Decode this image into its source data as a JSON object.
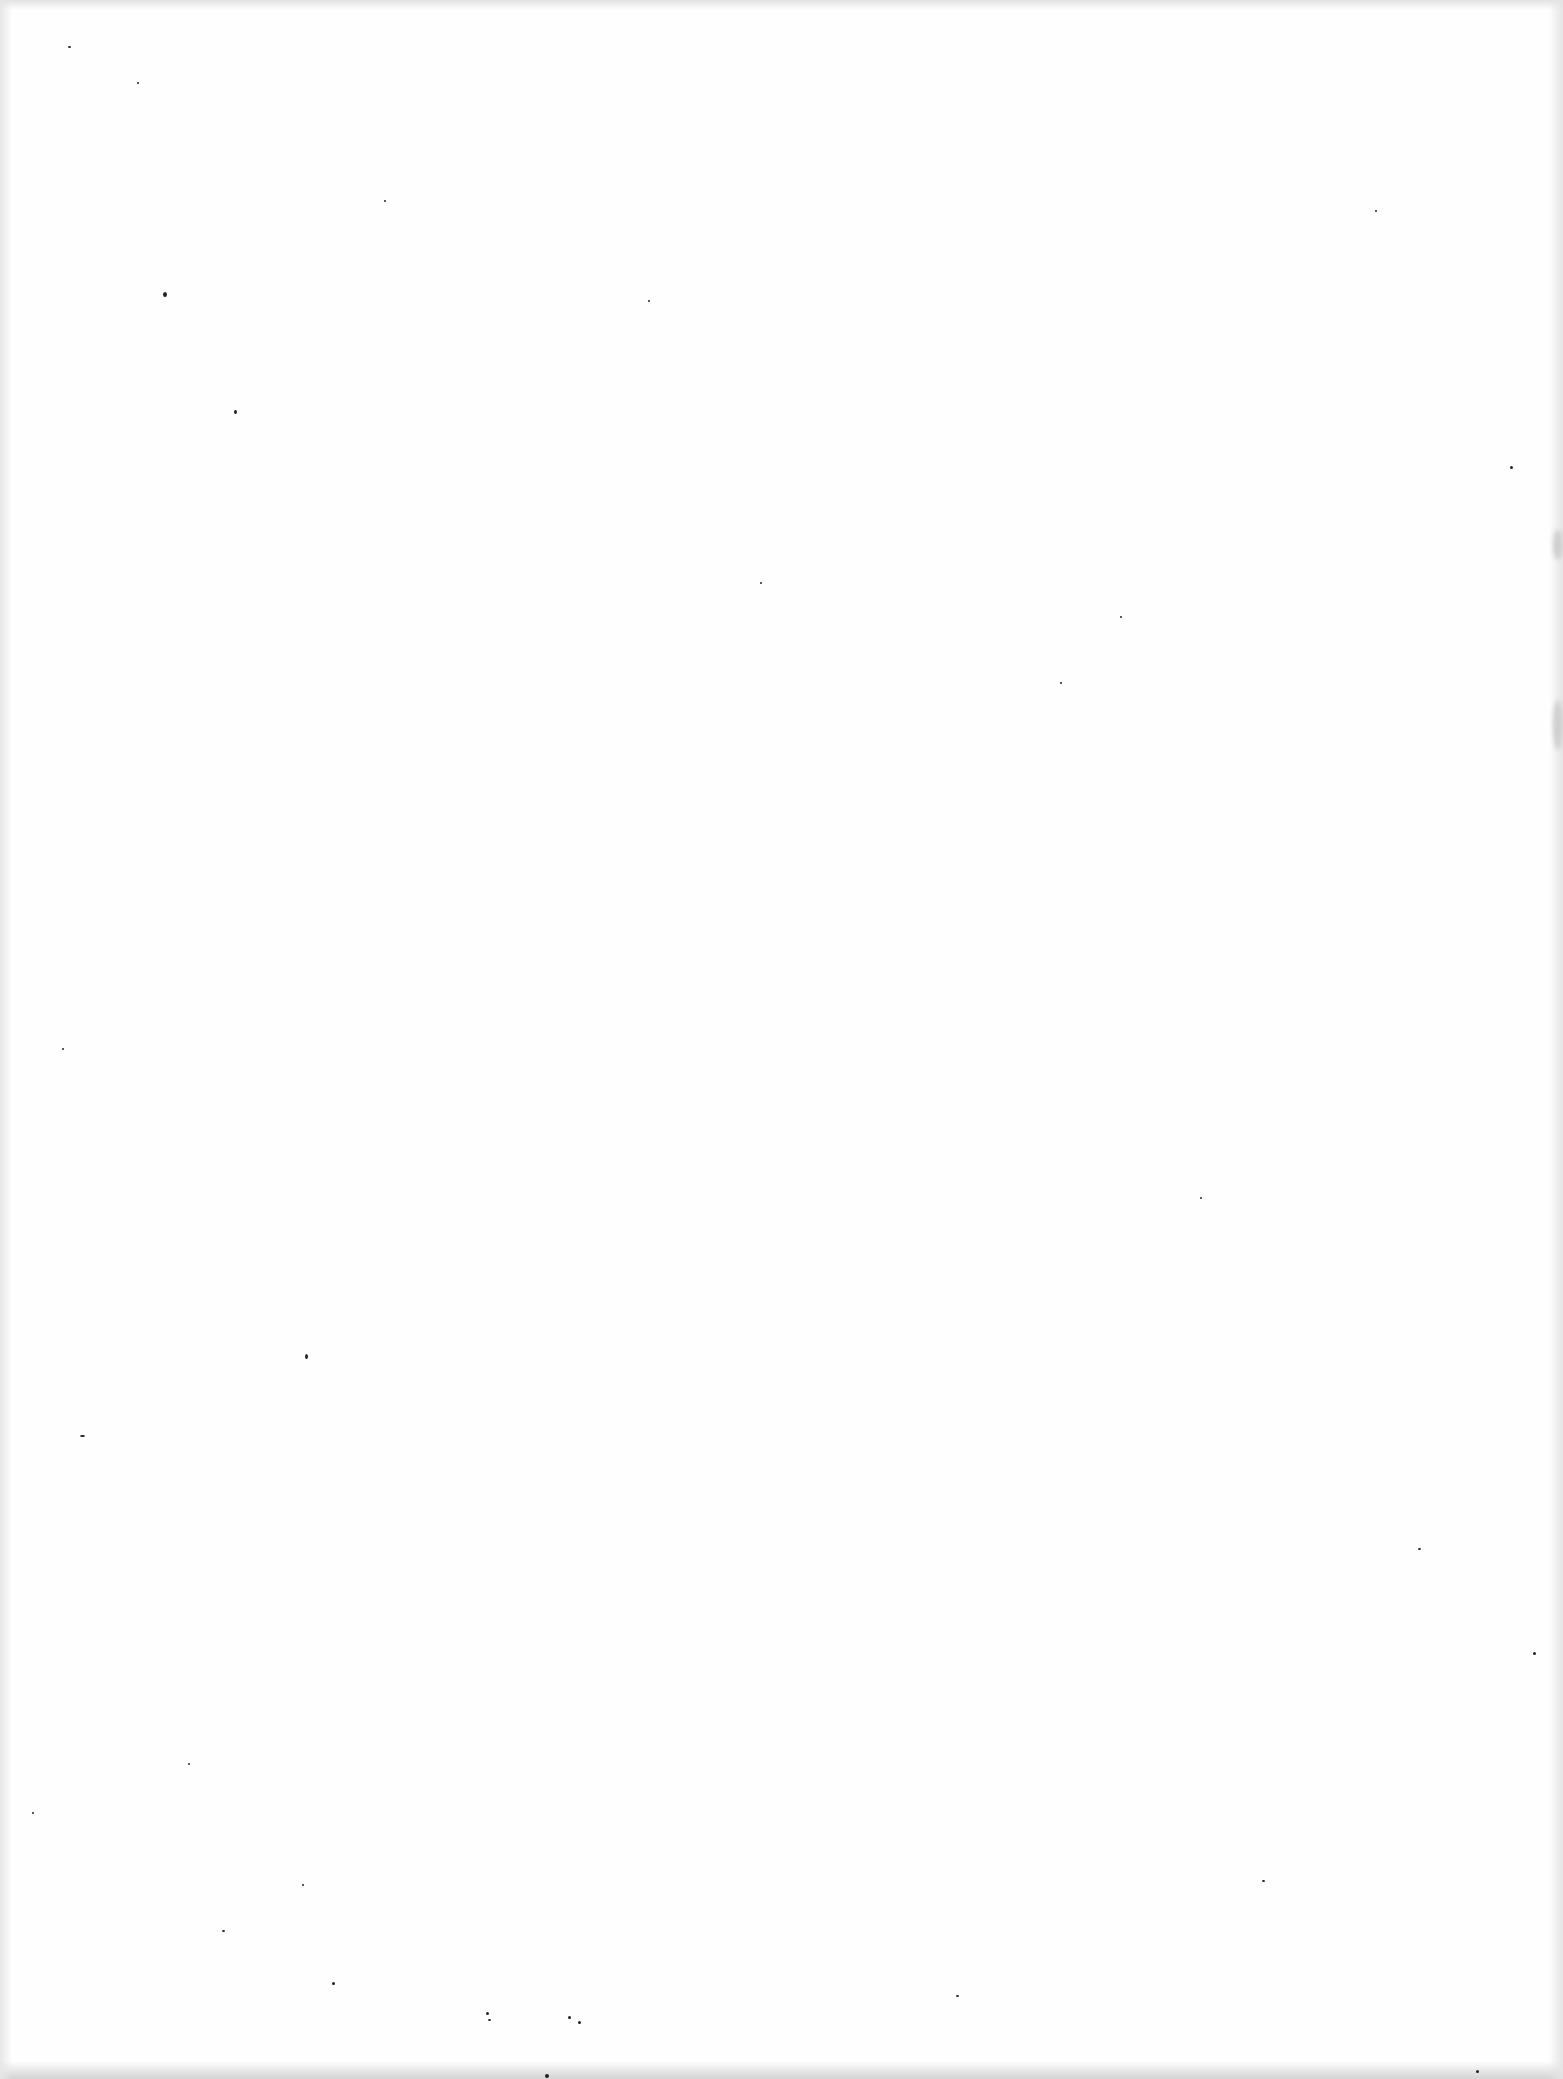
{
  "page": {
    "type": "blank scanned page",
    "text": "",
    "background_color": "#ffffff",
    "speck_color": "#222222"
  },
  "specks": [
    {
      "x": 68,
      "y": 46,
      "w": 3,
      "h": 2
    },
    {
      "x": 137,
      "y": 82,
      "w": 2,
      "h": 2
    },
    {
      "x": 163,
      "y": 292,
      "w": 4,
      "h": 5
    },
    {
      "x": 234,
      "y": 410,
      "w": 3,
      "h": 4
    },
    {
      "x": 384,
      "y": 200,
      "w": 2,
      "h": 2
    },
    {
      "x": 648,
      "y": 300,
      "w": 2,
      "h": 2
    },
    {
      "x": 1375,
      "y": 210,
      "w": 2,
      "h": 2
    },
    {
      "x": 1510,
      "y": 466,
      "w": 3,
      "h": 3
    },
    {
      "x": 1120,
      "y": 616,
      "w": 2,
      "h": 2
    },
    {
      "x": 1060,
      "y": 682,
      "w": 2,
      "h": 2
    },
    {
      "x": 760,
      "y": 582,
      "w": 2,
      "h": 2
    },
    {
      "x": 62,
      "y": 1048,
      "w": 2,
      "h": 2
    },
    {
      "x": 305,
      "y": 1354,
      "w": 3,
      "h": 5
    },
    {
      "x": 80,
      "y": 1435,
      "w": 5,
      "h": 2
    },
    {
      "x": 1200,
      "y": 1197,
      "w": 2,
      "h": 2
    },
    {
      "x": 1418,
      "y": 1548,
      "w": 3,
      "h": 2
    },
    {
      "x": 1533,
      "y": 1652,
      "w": 3,
      "h": 3
    },
    {
      "x": 188,
      "y": 1763,
      "w": 2,
      "h": 2
    },
    {
      "x": 32,
      "y": 1812,
      "w": 2,
      "h": 2
    },
    {
      "x": 302,
      "y": 1884,
      "w": 2,
      "h": 2
    },
    {
      "x": 1262,
      "y": 1880,
      "w": 3,
      "h": 2
    },
    {
      "x": 222,
      "y": 1930,
      "w": 3,
      "h": 2
    },
    {
      "x": 332,
      "y": 1982,
      "w": 3,
      "h": 3
    },
    {
      "x": 486,
      "y": 2012,
      "w": 3,
      "h": 3
    },
    {
      "x": 488,
      "y": 2019,
      "w": 3,
      "h": 2
    },
    {
      "x": 568,
      "y": 2016,
      "w": 3,
      "h": 3
    },
    {
      "x": 578,
      "y": 2021,
      "w": 3,
      "h": 3
    },
    {
      "x": 956,
      "y": 1995,
      "w": 3,
      "h": 2
    },
    {
      "x": 1476,
      "y": 2070,
      "w": 3,
      "h": 3
    },
    {
      "x": 545,
      "y": 2074,
      "w": 4,
      "h": 4
    }
  ]
}
